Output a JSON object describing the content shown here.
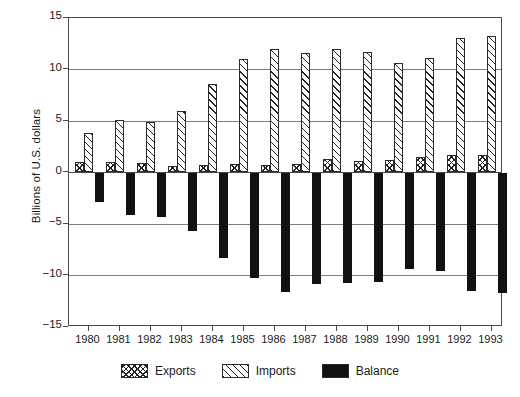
{
  "chart_data": {
    "type": "bar",
    "title": "",
    "xlabel": "",
    "ylabel": "Billions of U.S. dollars",
    "ylim": [
      -15,
      15
    ],
    "yticks": [
      15,
      10,
      5,
      0,
      -5,
      -10,
      -15
    ],
    "ytick_labels": [
      "15",
      "10",
      "5",
      "0",
      "−5",
      "−10",
      "−15"
    ],
    "grid": true,
    "legend_position": "bottom",
    "categories": [
      "1980",
      "1981",
      "1982",
      "1983",
      "1984",
      "1985",
      "1986",
      "1987",
      "1988",
      "1989",
      "1990",
      "1991",
      "1992",
      "1993"
    ],
    "series": [
      {
        "name": "Exports",
        "pattern": "cross-hatch",
        "color": "#ffffff",
        "values": [
          1.0,
          1.0,
          0.9,
          0.6,
          0.7,
          0.8,
          0.7,
          0.8,
          1.3,
          1.1,
          1.2,
          1.5,
          1.7,
          1.7
        ]
      },
      {
        "name": "Imports",
        "pattern": "diagonal-hatch",
        "color": "#ffffff",
        "values": [
          3.8,
          5.1,
          4.9,
          6.0,
          8.6,
          11.0,
          12.0,
          11.6,
          12.0,
          11.7,
          10.6,
          11.1,
          13.1,
          13.3
        ]
      },
      {
        "name": "Balance",
        "pattern": "solid",
        "color": "#111111",
        "values": [
          -2.9,
          -4.1,
          -4.3,
          -5.7,
          -8.3,
          -10.2,
          -11.6,
          -10.8,
          -10.7,
          -10.6,
          -9.4,
          -9.6,
          -11.5,
          -11.7
        ]
      }
    ]
  },
  "legend": {
    "items": [
      {
        "label": "Exports"
      },
      {
        "label": "Imports"
      },
      {
        "label": "Balance"
      }
    ]
  }
}
